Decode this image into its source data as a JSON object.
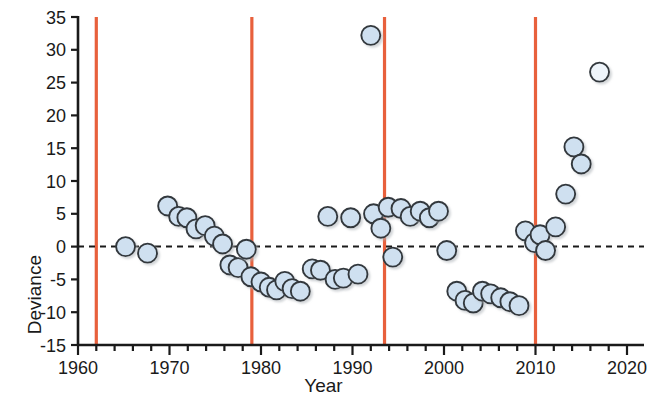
{
  "chart_data": {
    "type": "scatter",
    "title": "",
    "xlabel": "Year",
    "ylabel": "Deviance",
    "xlim": [
      1960,
      2020
    ],
    "ylim": [
      -15,
      35
    ],
    "xticks": [
      1960,
      1970,
      1980,
      1990,
      2000,
      2010,
      2020
    ],
    "xticklabels": [
      "1960",
      "1970",
      "1980",
      "1990",
      "2000",
      "2010",
      "2020"
    ],
    "xminor_step": 2,
    "yticks": [
      -15,
      -10,
      -5,
      0,
      5,
      10,
      15,
      20,
      25,
      30,
      35
    ],
    "yticklabels": [
      "-15",
      "-10",
      "-5",
      "0",
      "5",
      "10",
      "15",
      "20",
      "25",
      "30",
      "35"
    ],
    "grid": false,
    "legend": null,
    "reference_line": {
      "kind": "horizontal-dashed",
      "y": 0,
      "color": "#1a1a1a",
      "style": "dashed"
    },
    "vertical_lines": {
      "color": "#e8603c",
      "x": [
        1962,
        1979,
        1993.5,
        2010
      ]
    },
    "marker": {
      "shape": "circle",
      "fill": "#cfe0f0",
      "edge": "#33383d",
      "size_px": 19
    },
    "series": [
      {
        "name": "Deviance",
        "points": [
          {
            "x": 1965.2,
            "y": 0.0
          },
          {
            "x": 1967.6,
            "y": -1.0
          },
          {
            "x": 1969.8,
            "y": 6.2
          },
          {
            "x": 1971.0,
            "y": 4.6
          },
          {
            "x": 1971.9,
            "y": 4.4
          },
          {
            "x": 1972.9,
            "y": 2.7
          },
          {
            "x": 1973.9,
            "y": 3.2
          },
          {
            "x": 1974.9,
            "y": 1.6
          },
          {
            "x": 1975.8,
            "y": 0.4
          },
          {
            "x": 1976.6,
            "y": -2.8
          },
          {
            "x": 1977.5,
            "y": -3.2
          },
          {
            "x": 1978.4,
            "y": -0.4
          },
          {
            "x": 1978.9,
            "y": -4.6
          },
          {
            "x": 1980.0,
            "y": -5.4
          },
          {
            "x": 1980.9,
            "y": -6.2
          },
          {
            "x": 1981.7,
            "y": -6.6
          },
          {
            "x": 1982.6,
            "y": -5.3
          },
          {
            "x": 1983.4,
            "y": -6.4
          },
          {
            "x": 1984.3,
            "y": -6.8
          },
          {
            "x": 1985.6,
            "y": -3.4
          },
          {
            "x": 1986.5,
            "y": -3.6
          },
          {
            "x": 1987.3,
            "y": 4.6
          },
          {
            "x": 1988.1,
            "y": -5.0
          },
          {
            "x": 1989.0,
            "y": -4.8
          },
          {
            "x": 1989.8,
            "y": 4.4
          },
          {
            "x": 1990.6,
            "y": -4.2
          },
          {
            "x": 1992.0,
            "y": 32.2
          },
          {
            "x": 1992.3,
            "y": 5.0
          },
          {
            "x": 1993.1,
            "y": 2.8
          },
          {
            "x": 1993.9,
            "y": 6.0
          },
          {
            "x": 1994.4,
            "y": -1.6
          },
          {
            "x": 1995.3,
            "y": 5.8
          },
          {
            "x": 1996.3,
            "y": 4.6
          },
          {
            "x": 1997.4,
            "y": 5.4
          },
          {
            "x": 1998.4,
            "y": 4.4
          },
          {
            "x": 1999.4,
            "y": 5.4
          },
          {
            "x": 2000.3,
            "y": -0.6
          },
          {
            "x": 2001.4,
            "y": -6.8
          },
          {
            "x": 2002.3,
            "y": -8.2
          },
          {
            "x": 2003.2,
            "y": -8.6
          },
          {
            "x": 2004.2,
            "y": -6.8
          },
          {
            "x": 2005.1,
            "y": -7.2
          },
          {
            "x": 2006.2,
            "y": -7.8
          },
          {
            "x": 2007.2,
            "y": -8.4
          },
          {
            "x": 2008.2,
            "y": -9.0
          },
          {
            "x": 2008.9,
            "y": 2.4
          },
          {
            "x": 2009.9,
            "y": 0.6
          },
          {
            "x": 2010.5,
            "y": 1.8
          },
          {
            "x": 2011.1,
            "y": -0.6
          },
          {
            "x": 2012.2,
            "y": 3.0
          },
          {
            "x": 2013.3,
            "y": 8.0
          },
          {
            "x": 2014.2,
            "y": 15.2
          },
          {
            "x": 2015.0,
            "y": 12.6
          },
          {
            "x": 2017.0,
            "y": 26.6
          }
        ]
      }
    ],
    "highlight_points": [
      {
        "x": 2017.0,
        "y": 26.6,
        "fill": "#eef4fa"
      }
    ]
  }
}
